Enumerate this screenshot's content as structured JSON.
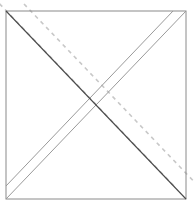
{
  "figure": {
    "canvas": {
      "width": 195,
      "height": 208,
      "background": "#ffffff"
    },
    "colors": {
      "square_stroke": "#8a8a8a",
      "solid_diagonal_stroke": "#4a4a4a",
      "parallel_solid_stroke": "#9a9a9a",
      "dashed_stroke": "#c8c8c8"
    },
    "square": {
      "label": "square-outline",
      "x": 6,
      "y": 11,
      "width": 180,
      "height": 188,
      "stroke_width": 1
    },
    "lines": [
      {
        "name": "main-diagonal-nw-se",
        "style": "solid",
        "color": "#4a4a4a",
        "width": 1.1,
        "x1": 6,
        "y1": 11,
        "x2": 186,
        "y2": 199
      },
      {
        "name": "dashed-parallel-upper-left",
        "style": "dashed",
        "color": "#c8c8c8",
        "width": 1.6,
        "dash": "4 4",
        "x1": -6,
        "y1": -2,
        "x2": 174,
        "y2": 186
      },
      {
        "name": "dashed-parallel-lower-right",
        "style": "dashed",
        "color": "#c8c8c8",
        "width": 1.6,
        "dash": "4 4",
        "x1": 24,
        "y1": 4,
        "x2": 204,
        "y2": 192
      },
      {
        "name": "main-diagonal-sw-ne",
        "style": "solid",
        "color": "#9a9a9a",
        "width": 1.0,
        "x1": 6,
        "y1": 199,
        "x2": 186,
        "y2": 11
      },
      {
        "name": "solid-parallel-sw-ne-offset",
        "style": "solid",
        "color": "#9a9a9a",
        "width": 1.0,
        "x1": 6,
        "y1": 186,
        "x2": 173,
        "y2": 11
      }
    ]
  }
}
